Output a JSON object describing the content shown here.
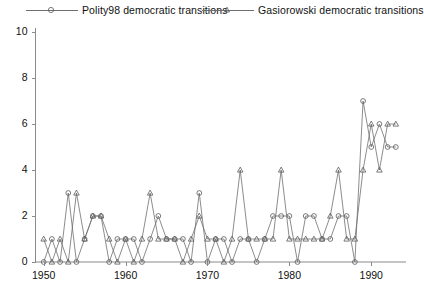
{
  "chart_data": {
    "type": "line",
    "title": "",
    "subtitle": "",
    "xlabel": "",
    "ylabel": "",
    "xlim": [
      1949,
      1994
    ],
    "ylim": [
      0,
      10
    ],
    "grid": false,
    "legend_position": "top",
    "x_ticks": [
      1950,
      1960,
      1970,
      1980,
      1990
    ],
    "x_tick_labels": [
      "1950",
      "1960",
      "1970",
      "1980",
      "1990"
    ],
    "y_ticks": [
      0,
      2,
      4,
      6,
      8,
      10
    ],
    "y_tick_labels": [
      "0",
      "2",
      "4",
      "6",
      "8",
      "10"
    ],
    "x": [
      1950,
      1951,
      1952,
      1953,
      1954,
      1955,
      1956,
      1957,
      1958,
      1959,
      1960,
      1961,
      1962,
      1963,
      1964,
      1965,
      1966,
      1967,
      1968,
      1969,
      1970,
      1971,
      1972,
      1973,
      1974,
      1975,
      1976,
      1977,
      1978,
      1979,
      1980,
      1981,
      1982,
      1983,
      1984,
      1985,
      1986,
      1987,
      1988,
      1989,
      1990,
      1991,
      1992,
      1993
    ],
    "series": [
      {
        "name": "Polity98 democratic transitions",
        "marker": "circle",
        "values": [
          0,
          1,
          0,
          3,
          0,
          1,
          2,
          2,
          0,
          1,
          1,
          1,
          0,
          1,
          2,
          1,
          1,
          1,
          0,
          3,
          0,
          1,
          1,
          0,
          1,
          1,
          0,
          1,
          2,
          2,
          2,
          0,
          2,
          2,
          1,
          1,
          2,
          2,
          0,
          7,
          5,
          6,
          5,
          5
        ]
      },
      {
        "name": "Gasiorowski democratic transitions",
        "marker": "triangle",
        "values": [
          1,
          0,
          1,
          0,
          3,
          1,
          2,
          2,
          1,
          0,
          1,
          0,
          1,
          3,
          1,
          1,
          1,
          0,
          1,
          2,
          1,
          1,
          0,
          1,
          4,
          1,
          1,
          1,
          1,
          4,
          1,
          1,
          1,
          1,
          1,
          2,
          4,
          1,
          1,
          4,
          6,
          4,
          6,
          6
        ]
      }
    ]
  },
  "legend": {
    "entries": [
      {
        "label": "Polity98 democratic transitions",
        "marker": "circle-marker"
      },
      {
        "label": "Gasiorowski democratic transitions",
        "marker": "triangle-marker"
      }
    ]
  },
  "axes": {
    "y_labels": [
      "10",
      "8",
      "6",
      "4",
      "2",
      "0"
    ],
    "x_labels": [
      "1950",
      "1960",
      "1970",
      "1980",
      "1990"
    ]
  },
  "colors": {
    "line": "#6f6f6f",
    "marker": "#5a5a5a",
    "axis": "#8a8a8a",
    "text": "#111111",
    "background": "#ffffff"
  }
}
